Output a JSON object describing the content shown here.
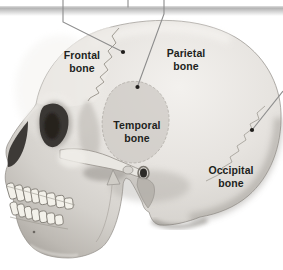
{
  "labels": {
    "frontal": {
      "line1": "Frontal",
      "line2": "bone"
    },
    "parietal": {
      "line1": "Parietal",
      "line2": "bone"
    },
    "temporal": {
      "line1": "Temporal",
      "line2": "bone"
    },
    "occipital": {
      "line1": "Occipital",
      "line2": "bone"
    }
  },
  "colors": {
    "background": "#ffffff",
    "label_text": "#211f1c",
    "leader_line": "#8c8c8c",
    "anchor_dot": "#1f1d1b",
    "top_band": "#b5b5b5",
    "bone_highlight": "#f3f1ee",
    "bone_mid": "#d6d3cf",
    "bone_shadow": "#a5a19b",
    "cavity_dark": "#38352f"
  }
}
